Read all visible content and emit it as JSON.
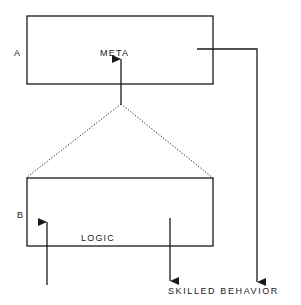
{
  "diagram": {
    "box_a": {
      "letter": "A",
      "label": "META"
    },
    "box_b": {
      "letter": "B",
      "label": "LOGIC"
    },
    "output_label": "SKILLED BEHAVIOR"
  },
  "colors": {
    "stroke": "#1a1a1a",
    "background": "#ffffff"
  }
}
